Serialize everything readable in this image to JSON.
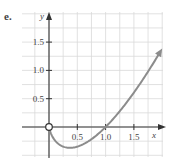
{
  "panel_label": "e.",
  "chart_data": {
    "type": "line",
    "title": "",
    "xlabel": "x",
    "ylabel": "y",
    "xlim": [
      -0.5,
      2.0
    ],
    "ylim": [
      -0.5,
      2.0
    ],
    "grid": true,
    "grid_step": 0.25,
    "x_ticks": [
      0.5,
      1.0,
      1.5
    ],
    "x_tick_labels": [
      "0.5",
      "1.0",
      "1.5"
    ],
    "y_ticks": [
      0.5,
      1.0,
      1.5
    ],
    "y_tick_labels": [
      "0.5",
      "1.0",
      "1.5"
    ],
    "series": [
      {
        "name": "y = x ln x",
        "x": [
          0.0,
          0.05,
          0.1,
          0.2,
          0.3,
          0.368,
          0.5,
          0.7,
          0.9,
          1.0,
          1.2,
          1.4,
          1.6,
          1.8,
          2.0
        ],
        "y": [
          0.0,
          -0.15,
          -0.23,
          -0.32,
          -0.36,
          -0.368,
          -0.35,
          -0.25,
          -0.09,
          0.0,
          0.22,
          0.47,
          0.75,
          1.06,
          1.39
        ],
        "open_point": [
          0,
          0
        ],
        "end_arrow": true,
        "color": "#8c8c8c"
      }
    ]
  },
  "colors": {
    "grid": "#d9d9d9",
    "axis": "#333333",
    "curve": "#8c8c8c",
    "text": "#444444"
  }
}
